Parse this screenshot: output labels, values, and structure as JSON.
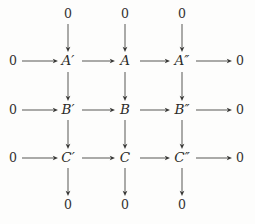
{
  "diagram": {
    "kind": "commutative-diagram",
    "background_color": "#fdfdfc",
    "ink_color": "#2a2a2a",
    "zero_label": "0",
    "columns": [
      {
        "name": "left-zero",
        "x": 13
      },
      {
        "name": "prime",
        "x": 68
      },
      {
        "name": "middle",
        "x": 125
      },
      {
        "name": "double-prime",
        "x": 182
      },
      {
        "name": "right-zero",
        "x": 240
      }
    ],
    "rows": [
      {
        "name": "top-zero",
        "y": 14
      },
      {
        "name": "row-a",
        "y": 61
      },
      {
        "name": "row-b",
        "y": 110
      },
      {
        "name": "row-c",
        "y": 158
      },
      {
        "name": "bottom-zero",
        "y": 205
      }
    ],
    "top_zeros": [
      {
        "label": "0",
        "x": 68,
        "y": 14
      },
      {
        "label": "0",
        "x": 125,
        "y": 14
      },
      {
        "label": "0",
        "x": 182,
        "y": 14
      }
    ],
    "bottom_zeros": [
      {
        "label": "0",
        "x": 68,
        "y": 205
      },
      {
        "label": "0",
        "x": 125,
        "y": 205
      },
      {
        "label": "0",
        "x": 182,
        "y": 205
      }
    ],
    "object_rows": [
      {
        "name": "row-a",
        "y": 61,
        "left_zero": "0",
        "right_zero": "0",
        "objects": [
          {
            "base": "A",
            "prime": "′",
            "full": "A′",
            "x": 68
          },
          {
            "base": "A",
            "prime": "",
            "full": "A",
            "x": 125
          },
          {
            "base": "A",
            "prime": "″",
            "full": "A″",
            "x": 182
          }
        ]
      },
      {
        "name": "row-b",
        "y": 110,
        "left_zero": "0",
        "right_zero": "0",
        "objects": [
          {
            "base": "B",
            "prime": "′",
            "full": "B′",
            "x": 68
          },
          {
            "base": "B",
            "prime": "",
            "full": "B",
            "x": 125
          },
          {
            "base": "B",
            "prime": "″",
            "full": "B″",
            "x": 182
          }
        ]
      },
      {
        "name": "row-c",
        "y": 158,
        "left_zero": "0",
        "right_zero": "0",
        "objects": [
          {
            "base": "C",
            "prime": "′",
            "full": "C′",
            "x": 68
          },
          {
            "base": "C",
            "prime": "",
            "full": "C",
            "x": 125
          },
          {
            "base": "C",
            "prime": "″",
            "full": "C″",
            "x": 182
          }
        ]
      }
    ],
    "horizontal_arrows": [
      {
        "row": "row-a",
        "y": 61,
        "x1": 22,
        "x2": 58,
        "label": ""
      },
      {
        "row": "row-a",
        "y": 61,
        "x1": 82,
        "x2": 115,
        "label": ""
      },
      {
        "row": "row-a",
        "y": 61,
        "x1": 140,
        "x2": 170,
        "label": ""
      },
      {
        "row": "row-a",
        "y": 61,
        "x1": 196,
        "x2": 232,
        "label": ""
      },
      {
        "row": "row-b",
        "y": 110,
        "x1": 22,
        "x2": 58,
        "label": ""
      },
      {
        "row": "row-b",
        "y": 110,
        "x1": 82,
        "x2": 115,
        "label": ""
      },
      {
        "row": "row-b",
        "y": 110,
        "x1": 140,
        "x2": 170,
        "label": ""
      },
      {
        "row": "row-b",
        "y": 110,
        "x1": 196,
        "x2": 232,
        "label": ""
      },
      {
        "row": "row-c",
        "y": 158,
        "x1": 22,
        "x2": 58,
        "label": ""
      },
      {
        "row": "row-c",
        "y": 158,
        "x1": 82,
        "x2": 115,
        "label": ""
      },
      {
        "row": "row-c",
        "y": 158,
        "x1": 140,
        "x2": 170,
        "label": ""
      },
      {
        "row": "row-c",
        "y": 158,
        "x1": 196,
        "x2": 232,
        "label": ""
      }
    ],
    "vertical_arrows": [
      {
        "column": "prime",
        "x": 68,
        "y1": 24,
        "y2": 52,
        "label": ""
      },
      {
        "column": "middle",
        "x": 125,
        "y1": 24,
        "y2": 52,
        "label": ""
      },
      {
        "column": "double-prime",
        "x": 182,
        "y1": 24,
        "y2": 52,
        "label": ""
      },
      {
        "column": "prime",
        "x": 68,
        "y1": 72,
        "y2": 101,
        "label": ""
      },
      {
        "column": "middle",
        "x": 125,
        "y1": 72,
        "y2": 101,
        "label": ""
      },
      {
        "column": "double-prime",
        "x": 182,
        "y1": 72,
        "y2": 101,
        "label": ""
      },
      {
        "column": "prime",
        "x": 68,
        "y1": 120,
        "y2": 149,
        "label": ""
      },
      {
        "column": "middle",
        "x": 125,
        "y1": 120,
        "y2": 149,
        "label": ""
      },
      {
        "column": "double-prime",
        "x": 182,
        "y1": 120,
        "y2": 149,
        "label": ""
      },
      {
        "column": "prime",
        "x": 68,
        "y1": 168,
        "y2": 196,
        "label": ""
      },
      {
        "column": "middle",
        "x": 125,
        "y1": 168,
        "y2": 196,
        "label": ""
      },
      {
        "column": "double-prime",
        "x": 182,
        "y1": 168,
        "y2": 196,
        "label": ""
      }
    ]
  }
}
